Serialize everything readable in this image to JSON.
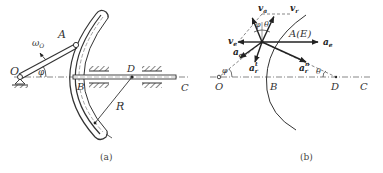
{
  "figure_a": {
    "caption": "(a)",
    "labels": {
      "O": "O",
      "A": "A",
      "B": "B",
      "C": "C",
      "D": "D",
      "R": "R",
      "phi": "φ",
      "omega": "ω",
      "omega_sub": "O"
    }
  },
  "figure_b": {
    "caption": "(b)",
    "labels": {
      "O": "O",
      "B": "B",
      "C": "C",
      "D": "D",
      "AE": "A(E)",
      "phi": "φ",
      "theta": "θ",
      "phi_top": "φ",
      "theta_top": "θ",
      "v_a": "v",
      "v_a_sub": "a",
      "v_r": "v",
      "v_r_sub": "r",
      "v_e": "v",
      "v_e_sub": "e",
      "a_e": "a",
      "a_e_sub": "e",
      "a_a": "a",
      "a_a_sub": "a",
      "a_rt": "a",
      "a_rt_sub": "r",
      "a_rt_sup": "t",
      "a_rn": "a",
      "a_rn_sub": "r",
      "a_rn_sup": "n"
    }
  },
  "colors": {
    "line": "#333333",
    "text": "#333333"
  }
}
